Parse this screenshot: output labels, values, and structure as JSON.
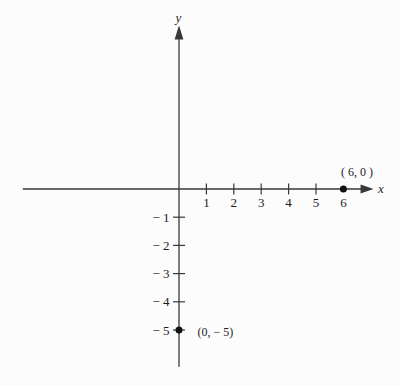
{
  "figure": {
    "background": "#fcfcfc",
    "axis_color": "#383838",
    "text_color": "#1d1d1d",
    "point_color": "#111111"
  },
  "chart_data": {
    "type": "scatter",
    "title": "",
    "xlabel": "x",
    "ylabel": "y",
    "points": [
      {
        "x": 6,
        "y": 0,
        "label": "( 6, 0 )"
      },
      {
        "x": 0,
        "y": -5,
        "label": "(0, − 5)"
      }
    ],
    "x_axis": {
      "tick_values": [
        1,
        2,
        3,
        4,
        5,
        6
      ],
      "tick_labels": [
        "1",
        "2",
        "3",
        "4",
        "5",
        "6"
      ],
      "tick_marks": [
        1,
        2,
        3,
        4,
        5
      ]
    },
    "y_axis": {
      "tick_values": [
        -1,
        -2,
        -3,
        -4,
        -5
      ],
      "tick_labels": [
        "− 1",
        "− 2",
        "− 3",
        "− 4",
        "− 5"
      ],
      "tick_marks": [
        -1,
        -2,
        -3,
        -4,
        -5
      ]
    },
    "xlim": [
      -5.7,
      7.1
    ],
    "ylim": [
      -6.3,
      5.8
    ],
    "grid": false,
    "legend": null
  }
}
